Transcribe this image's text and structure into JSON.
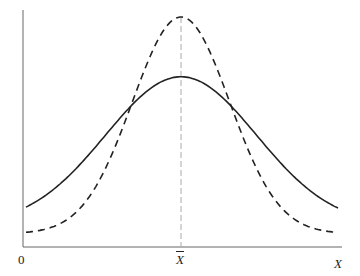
{
  "chart_data": {
    "type": "line",
    "title": "",
    "xlabel": "X",
    "ylabel": "",
    "x_ticks": [
      {
        "label": "0",
        "position": "origin"
      },
      {
        "label": "X̄",
        "position": "mean"
      }
    ],
    "grid": false,
    "legend": null,
    "series": [
      {
        "name": "wider distribution",
        "style": "solid",
        "color": "#222222",
        "mean": 0,
        "sd": 1.55,
        "peak_rel": 0.74,
        "tail_rel": 0.095
      },
      {
        "name": "narrower distribution",
        "style": "dashed",
        "color": "#222222",
        "mean": 0,
        "sd": 1.0,
        "peak_rel": 1.0,
        "tail_rel": 0.058
      }
    ],
    "annotations": [
      {
        "type": "vertical-dashed-line",
        "at": "mean",
        "color": "#aaaaaa"
      }
    ],
    "plot_px": {
      "x0": 23,
      "y0": 247,
      "x1": 342,
      "ytop": 10,
      "mean_x": 181,
      "dashed_peak_y": 17,
      "solid_peak_y": 93
    }
  },
  "labels": {
    "origin": "0",
    "mean": "X",
    "x_axis": "X"
  }
}
